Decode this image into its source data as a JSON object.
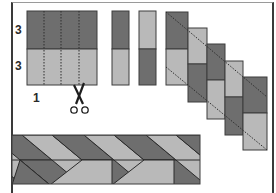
{
  "diagram": {
    "title": "",
    "labels": {
      "top_height": "3",
      "bottom_height": "3",
      "strip_width": "1"
    },
    "colors": {
      "dark": "#6e6e6e",
      "light": "#b9b9b9",
      "outline": "#3c3c3c",
      "frame": "#3a3a3a",
      "background": "#ffffff"
    },
    "steps": [
      {
        "id": "sewn-block",
        "description": "Two fabric bands (dark on top, light on bottom) sewn together, marked with dotted cutting lines"
      },
      {
        "id": "cut-strips",
        "description": "Block cut into strips; alternate strips flipped"
      },
      {
        "id": "staircase",
        "description": "Strips offset diagonally into a staircase with dotted diagonal trim lines"
      },
      {
        "id": "braided-band",
        "description": "Resulting diagonal braided band"
      }
    ],
    "icons": [
      "scissors-icon"
    ]
  }
}
